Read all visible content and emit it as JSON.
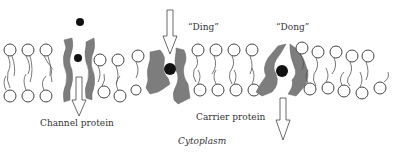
{
  "diagram": {
    "labels": {
      "channel": "Channel protein",
      "carrier": "Carrier protein",
      "cytoplasm": "Cytoplasm",
      "ding": "“Ding”",
      "dong": "“Dong”"
    },
    "colors": {
      "protein": "#7d7d7d",
      "ion": "#111111",
      "lipid_outline": "#444444",
      "background": "#ffffff"
    },
    "components": [
      {
        "name": "channel-protein",
        "state": "open pore with ion passing through, arrow pointing into cell"
      },
      {
        "name": "carrier-protein-ding",
        "state": "open to outside, ion bound, arrow entering from top"
      },
      {
        "name": "carrier-protein-dong",
        "state": "open to cytoplasm, ion released, arrow exiting downward"
      }
    ]
  }
}
